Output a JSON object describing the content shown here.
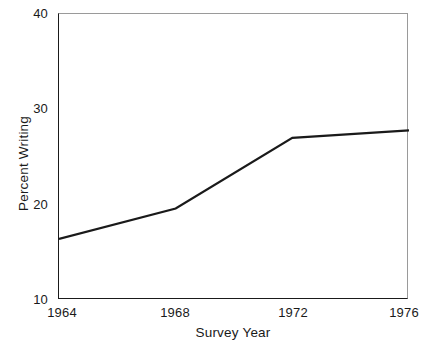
{
  "chart_data": {
    "type": "line",
    "title": "",
    "subtitle": "",
    "xlabel": "Survey Year",
    "ylabel": "Percent Writing",
    "x": [
      1964,
      1968,
      1972,
      1976
    ],
    "values": [
      16.4,
      19.6,
      27.0,
      27.8
    ],
    "series": [
      {
        "name": "Percent Writing",
        "values": [
          16.4,
          19.6,
          27.0,
          27.8
        ],
        "color": "#1a1a1a"
      }
    ],
    "xlim": [
      1964,
      1976
    ],
    "ylim": [
      10,
      40
    ],
    "xticks": [
      1964,
      1968,
      1972,
      1976
    ],
    "xtick_labels": [
      "1964",
      "1968",
      "1972",
      "1976"
    ],
    "yticks": [
      10,
      20,
      30,
      40
    ],
    "ytick_labels": [
      "10",
      "20",
      "30",
      "40"
    ],
    "grid": false,
    "legend": false,
    "legend_position": "none",
    "markers": false,
    "line_color": "#1a1a1a",
    "background_color": "#ffffff",
    "frame": "box"
  },
  "axes": {
    "y": {
      "title": "Percent Writing",
      "ticks": [
        {
          "label": "40",
          "value": 40
        },
        {
          "label": "30",
          "value": 30
        },
        {
          "label": "20",
          "value": 20
        },
        {
          "label": "10",
          "value": 10
        }
      ]
    },
    "x": {
      "title": "Survey Year",
      "ticks": [
        {
          "label": "1964",
          "value": 1964
        },
        {
          "label": "1968",
          "value": 1968
        },
        {
          "label": "1972",
          "value": 1972
        },
        {
          "label": "1976",
          "value": 1976
        }
      ]
    }
  }
}
